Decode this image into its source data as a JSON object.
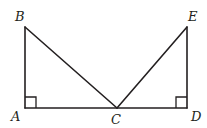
{
  "diagram": {
    "type": "geometry",
    "points": {
      "A": {
        "label": "A",
        "x": 25,
        "y": 108
      },
      "B": {
        "label": "B",
        "x": 25,
        "y": 27
      },
      "C": {
        "label": "C",
        "x": 117,
        "y": 108
      },
      "D": {
        "label": "D",
        "x": 187,
        "y": 108
      },
      "E": {
        "label": "E",
        "x": 187,
        "y": 27
      }
    },
    "segments": [
      {
        "from": "A",
        "to": "B"
      },
      {
        "from": "B",
        "to": "C"
      },
      {
        "from": "A",
        "to": "D"
      },
      {
        "from": "C",
        "to": "E"
      },
      {
        "from": "E",
        "to": "D"
      }
    ],
    "right_angles": [
      "A",
      "D"
    ],
    "labels": {
      "A": "A",
      "B": "B",
      "C": "C",
      "D": "D",
      "E": "E"
    },
    "colors": {
      "stroke": "#231f20",
      "background": "#ffffff"
    }
  }
}
